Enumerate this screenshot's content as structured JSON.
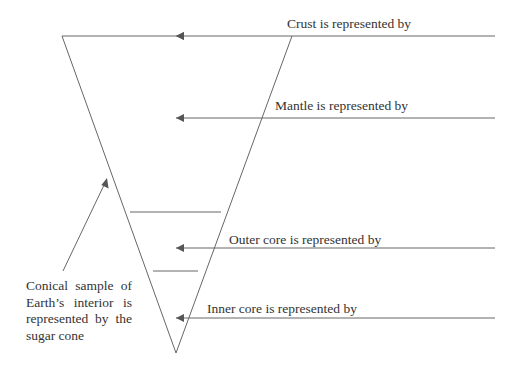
{
  "diagram": {
    "labels": {
      "crust": "Crust is represented by",
      "mantle": "Mantle is represented by",
      "outer_core": "Outer core is represented by",
      "inner_core": "Inner core is represented by"
    },
    "caption_lines": [
      "Conical sample of",
      "Earth’s interior is",
      "represented by the",
      "sugar cone"
    ],
    "colors": {
      "line": "#666666",
      "text": "#333333",
      "background": "#ffffff"
    }
  }
}
